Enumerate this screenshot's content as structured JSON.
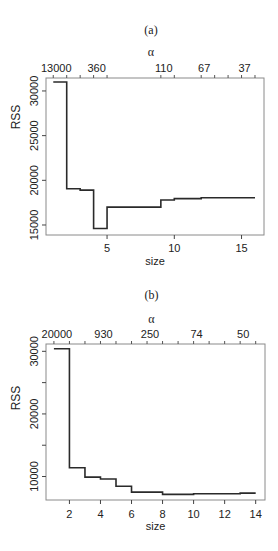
{
  "chart_data": [
    {
      "id": "a",
      "type": "line",
      "step": true,
      "title": "(a)",
      "xlabel": "size",
      "ylabel": "RSS",
      "top_axis_label": "α",
      "x": [
        1,
        2,
        3,
        4,
        5,
        6,
        7,
        8,
        9,
        10,
        11,
        12,
        13,
        14,
        15,
        16
      ],
      "series": [
        {
          "name": "RSS",
          "values": [
            31000,
            19050,
            18900,
            14600,
            17000,
            17000,
            17000,
            17000,
            17800,
            17950,
            17950,
            18050,
            18050,
            18050,
            18050,
            18050
          ]
        }
      ],
      "xlim": [
        0.46,
        16.67
      ],
      "ylim": [
        13880,
        31450
      ],
      "x_ticks": [
        5,
        10,
        15
      ],
      "x_tick_labels": [
        "5",
        "10",
        "15"
      ],
      "y_ticks": [
        15000,
        20000,
        25000,
        30000
      ],
      "y_tick_labels": [
        "15000",
        "20000",
        "25000",
        "30000"
      ],
      "top_ticks": [
        1,
        2,
        3,
        4,
        5,
        9,
        10,
        12,
        13,
        14,
        15,
        16
      ],
      "top_tick_labels": [
        {
          "at": 1,
          "label": "13000"
        },
        {
          "at": 4,
          "label": "360"
        },
        {
          "at": 9,
          "label": "110"
        },
        {
          "at": 12,
          "label": "67"
        },
        {
          "at": 15,
          "label": "37"
        }
      ],
      "grid": false,
      "legend": "none"
    },
    {
      "id": "b",
      "type": "line",
      "step": true,
      "title": "(b)",
      "xlabel": "size",
      "ylabel": "RSS",
      "top_axis_label": "α",
      "x": [
        1,
        2,
        3,
        4,
        5,
        6,
        7,
        8,
        9,
        10,
        11,
        12,
        13,
        14
      ],
      "series": [
        {
          "name": "RSS",
          "values": [
            30400,
            11400,
            9900,
            9600,
            8450,
            7500,
            7500,
            7150,
            7150,
            7250,
            7250,
            7250,
            7350,
            7350
          ]
        }
      ],
      "xlim": [
        0.49,
        14.6
      ],
      "ylim": [
        6250,
        31170
      ],
      "x_ticks": [
        2,
        4,
        6,
        8,
        10,
        12,
        14
      ],
      "x_tick_labels": [
        "2",
        "4",
        "6",
        "8",
        "10",
        "12",
        "14"
      ],
      "y_ticks": [
        10000,
        15000,
        20000,
        25000,
        30000
      ],
      "y_tick_labels": [
        "10000",
        "",
        "20000",
        "",
        "30000"
      ],
      "top_ticks": [
        1,
        2,
        3,
        4,
        5,
        6,
        7,
        8,
        9,
        10,
        11,
        12,
        13,
        14
      ],
      "top_tick_labels": [
        {
          "at": 1,
          "label": "20000"
        },
        {
          "at": 4,
          "label": "930"
        },
        {
          "at": 7,
          "label": "250"
        },
        {
          "at": 10,
          "label": "74"
        },
        {
          "at": 13,
          "label": "50"
        }
      ],
      "grid": false,
      "legend": "none"
    }
  ],
  "colors": {
    "line": "#2a2a2a",
    "frame": "#8a8a8a",
    "text": "#222222"
  }
}
